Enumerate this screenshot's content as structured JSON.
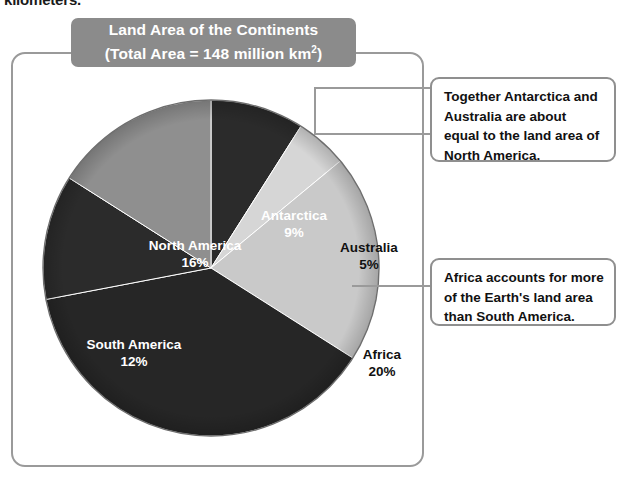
{
  "page": {
    "cutoff_body_text": "kilometers."
  },
  "chart_title": {
    "line1": "Land Area of the Continents",
    "line2_prefix": "(Total Area  =  148 million km",
    "line2_sup": "2",
    "line2_suffix": ")",
    "plate_color": "#8b8b8b",
    "text_color": "#ffffff"
  },
  "callouts": [
    {
      "id": "antarctica-australia",
      "text": "Together Antarctica and Australia are about equal to the land area of North America.",
      "target_slices": [
        "Antarctica",
        "Australia"
      ]
    },
    {
      "id": "africa",
      "text": "Africa accounts for more of the Earth's land area than South America.",
      "target_slices": [
        "Africa"
      ]
    }
  ],
  "chart_data": {
    "type": "pie",
    "title": "Land Area of the Continents (Total Area = 148 million km2)",
    "xlabel": "",
    "ylabel": "",
    "total_label": "Total Area = 148 million km²",
    "total_value": 148,
    "total_units": "million km²",
    "units": "percent",
    "grid": false,
    "legend": "none",
    "start_angle_deg": 0,
    "direction": "clockwise",
    "labels": [
      "Antarctica",
      "Australia",
      "Africa",
      "Europe and Asia",
      "South America",
      "North America"
    ],
    "values": [
      9,
      5,
      20,
      38,
      12,
      16
    ],
    "value_labels": [
      "9%",
      "5%",
      "20%",
      "38%",
      "12%",
      "16%"
    ],
    "colors": [
      "#2b2b2b",
      "#d6d6d6",
      "#c9c9c9",
      "#262626",
      "#2b2b2b",
      "#8f8f8f"
    ],
    "label_text_colors": [
      "#ffffff",
      "#111111",
      "#111111",
      "#ffffff",
      "#ffffff",
      "#ffffff"
    ],
    "slices": [
      {
        "label": "Antarctica",
        "value": 9,
        "value_label": "9%",
        "color": "#2b2b2b",
        "label_color": "#ffffff"
      },
      {
        "label": "Australia",
        "value": 5,
        "value_label": "5%",
        "color": "#d6d6d6",
        "label_color": "#111111"
      },
      {
        "label": "Africa",
        "value": 20,
        "value_label": "20%",
        "color": "#c9c9c9",
        "label_color": "#111111"
      },
      {
        "label": "Europe and Asia",
        "value": 38,
        "value_label": "38%",
        "color": "#262626",
        "label_color": "#ffffff"
      },
      {
        "label": "South America",
        "value": 12,
        "value_label": "12%",
        "color": "#2b2b2b",
        "label_color": "#ffffff"
      },
      {
        "label": "North America",
        "value": 16,
        "value_label": "16%",
        "color": "#8f8f8f",
        "label_color": "#ffffff"
      }
    ]
  },
  "colors": {
    "frame_border": "#9a9a9a",
    "callout_border": "#8f8f8f",
    "leader_line": "#9a9a9a",
    "page_background": "#ffffff"
  }
}
